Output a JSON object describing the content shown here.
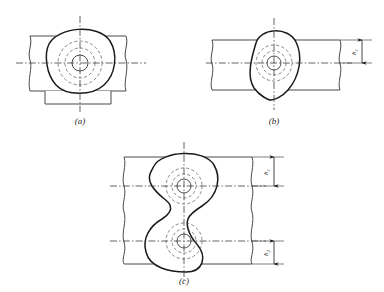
{
  "document": {
    "kind": "engineering-drawing",
    "title": "Rounded-triangular cam profile engagement views",
    "background_color": "#ffffff",
    "ink_color": "#1a1a1a",
    "thin_ink_color": "#4a4a4a",
    "centerline_color": "#3c3c3c"
  },
  "figures": [
    {
      "id": "a",
      "caption": "(a)",
      "caption_text": "a",
      "description": "Rounded-triangle profile with flat side down, seated on a bar with a base plate beneath",
      "has_base_plate": true,
      "has_dimension": false,
      "profile_orientation": "flat-bottom",
      "hidden_circles": 2,
      "solid_circles": 1
    },
    {
      "id": "b",
      "caption": "(b)",
      "caption_text": "b",
      "description": "Rounded-triangle profile pointing down, overlapping a single bar, height h1 dimensioned at right",
      "has_base_plate": false,
      "has_dimension": true,
      "profile_orientation": "point-down",
      "hidden_circles": 2,
      "solid_circles": 1
    },
    {
      "id": "c",
      "caption": "(c)",
      "caption_text": "c",
      "description": "Two mirrored rounded-triangle profiles forming a figure-eight across two bars, heights h1 and h2 dimensioned at right",
      "has_base_plate": false,
      "has_dimension": true,
      "profile_orientation": "mirrored-pair",
      "hidden_circles": 4,
      "solid_circles": 2
    }
  ],
  "dimensions": [
    {
      "id": "h1-b",
      "figure": "b",
      "symbol": "h",
      "subscript": "1",
      "label": "h1"
    },
    {
      "id": "h1-c",
      "figure": "c",
      "symbol": "h",
      "subscript": "1",
      "label": "h1"
    },
    {
      "id": "h2-c",
      "figure": "c",
      "symbol": "h",
      "subscript": "2",
      "label": "h2"
    }
  ],
  "line_styles": {
    "outline": "solid-thick",
    "bar_edge": "solid-thin",
    "hidden": "dashed",
    "center": "dash-dot"
  }
}
